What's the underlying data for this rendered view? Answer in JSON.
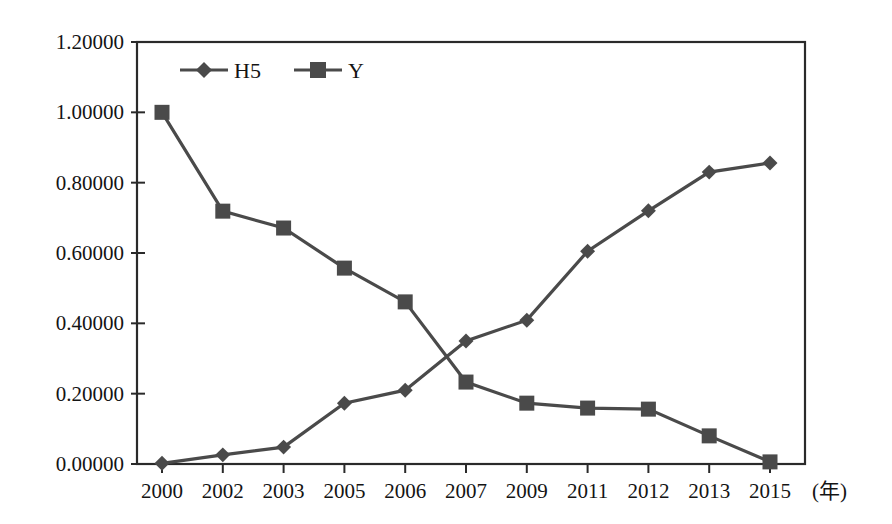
{
  "chart_data": {
    "type": "line",
    "title": "",
    "xlabel": "(年)",
    "ylabel": "",
    "categories": [
      "2000",
      "2002",
      "2003",
      "2005",
      "2006",
      "2007",
      "2009",
      "2011",
      "2012",
      "2013",
      "2015"
    ],
    "series": [
      {
        "name": "H5",
        "marker": "diamond",
        "color": "#4a4a4a",
        "values": [
          0.002,
          0.026,
          0.048,
          0.173,
          0.21,
          0.35,
          0.409,
          0.605,
          0.72,
          0.83,
          0.856
        ]
      },
      {
        "name": "Y",
        "marker": "square",
        "color": "#4a4a4a",
        "values": [
          1.0,
          0.719,
          0.671,
          0.557,
          0.461,
          0.233,
          0.173,
          0.159,
          0.156,
          0.08,
          0.006
        ]
      }
    ],
    "ylim": [
      0.0,
      1.2
    ],
    "yticks": [
      0.0,
      0.2,
      0.4,
      0.6,
      0.8,
      1.0,
      1.2
    ],
    "ytick_labels": [
      "0.00000",
      "0.20000",
      "0.40000",
      "0.60000",
      "0.80000",
      "1.00000",
      "1.20000"
    ],
    "grid": false,
    "legend": {
      "position": "top-left-inside",
      "entries": [
        {
          "label": "H5",
          "marker": "diamond"
        },
        {
          "label": "Y",
          "marker": "square"
        }
      ]
    },
    "axis_unit_label": "(年)"
  }
}
